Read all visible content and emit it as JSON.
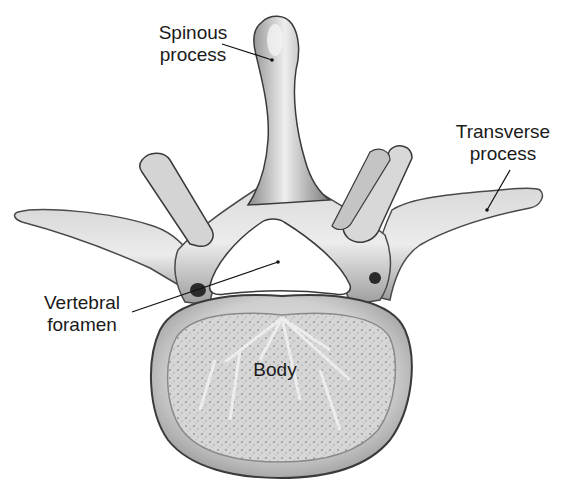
{
  "diagram": {
    "labels": {
      "spinous_process": {
        "line1": "Spinous",
        "line2": "process"
      },
      "transverse_process": {
        "line1": "Transverse",
        "line2": "process"
      },
      "vertebral_foramen": {
        "line1": "Vertebral",
        "line2": "foramen"
      },
      "body": {
        "text": "Body"
      }
    },
    "colors": {
      "bone_light": "#e6e6e6",
      "bone_mid": "#b8b8b8",
      "bone_dark": "#6a6a6a",
      "outline": "#3a3a3a",
      "label_text": "#1a1a1a",
      "background": "#ffffff"
    }
  }
}
